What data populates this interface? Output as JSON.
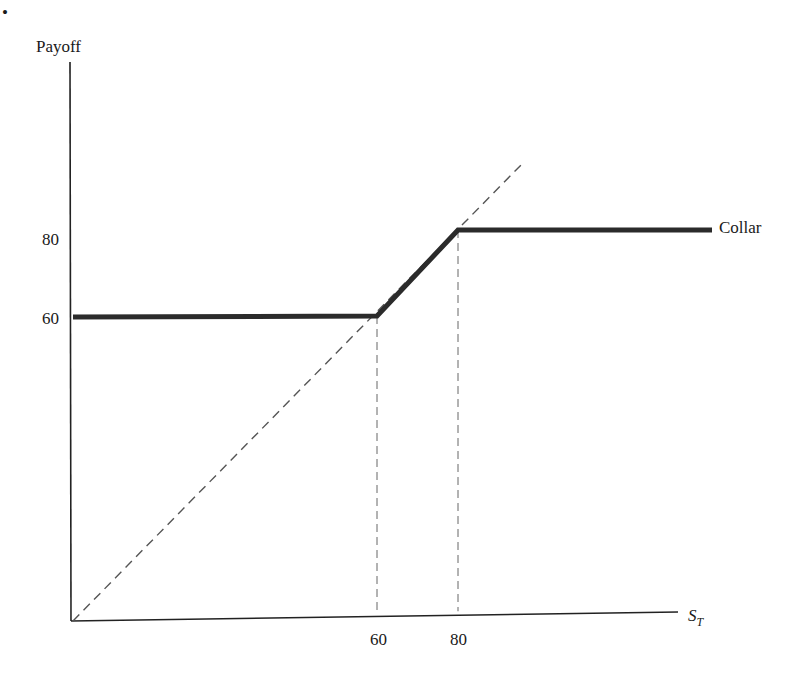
{
  "page": {
    "bullet": "•"
  },
  "chart_data": {
    "type": "line",
    "title": "",
    "xlabel": "S_T",
    "xlabel_main": "S",
    "xlabel_sub": "T",
    "ylabel": "Payoff",
    "x_ticks": [
      60,
      80
    ],
    "y_ticks": [
      80,
      60
    ],
    "x_tick_labels": [
      "60",
      "80"
    ],
    "y_tick_labels": [
      "80",
      "60"
    ],
    "grid": false,
    "legend": "inline label at right end of collar line",
    "series": [
      {
        "name": "Collar",
        "style": "solid-thick",
        "color": "#2b2b2b",
        "x": [
          0,
          60,
          80,
          100
        ],
        "y": [
          60,
          60,
          80,
          80
        ]
      },
      {
        "name": "Stock (45° line)",
        "style": "dashed",
        "color": "#555555",
        "x": [
          0,
          90
        ],
        "y": [
          0,
          90
        ]
      }
    ],
    "reference_lines": [
      {
        "orientation": "vertical",
        "x": 60,
        "from_y": 0,
        "to_y": 60,
        "style": "dashed"
      },
      {
        "orientation": "vertical",
        "x": 80,
        "from_y": 0,
        "to_y": 80,
        "style": "dashed"
      }
    ],
    "annotations": [
      {
        "text": "Collar",
        "at": "right end of collar line"
      }
    ]
  }
}
